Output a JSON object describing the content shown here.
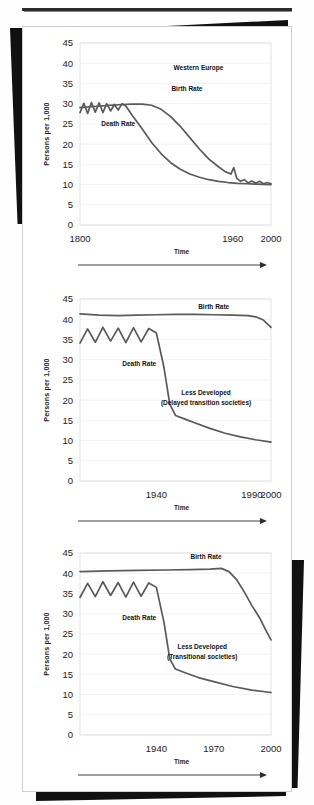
{
  "page": {
    "kind": "textbook-figure-scan",
    "ylabel": "Persons per 1,000",
    "xtitle": "Time",
    "series_names": {
      "birth": "Birth Rate",
      "death": "Death Rate"
    },
    "line_color": "#5a5a5a",
    "text_color": "#1c1c1c",
    "y_ticks": [
      "0",
      "5",
      "10",
      "15",
      "20",
      "25",
      "30",
      "35",
      "40",
      "45"
    ]
  },
  "chart_data": [
    {
      "type": "line",
      "title": "Western Europe",
      "xlabel": "Time",
      "ylabel": "Persons per 1,000",
      "ylim": [
        0,
        45
      ],
      "xlim": [
        1800,
        2000
      ],
      "grid": true,
      "legend": "inline-annotations",
      "xtick_labels": [
        "1800",
        "1960",
        "2000"
      ],
      "xtick_values": [
        1800,
        1960,
        2000
      ],
      "ytick_labels": [
        "0",
        "5",
        "10",
        "15",
        "20",
        "25",
        "30",
        "35",
        "40",
        "45"
      ],
      "annotations": [
        "Western Europe",
        "Birth Rate",
        "Death Rate"
      ],
      "series": [
        {
          "name": "Birth Rate",
          "x": [
            1800,
            1815,
            1830,
            1845,
            1855,
            1865,
            1875,
            1885,
            1895,
            1905,
            1915,
            1925,
            1935,
            1945,
            1952,
            1958,
            1961,
            1964,
            1968,
            1972,
            1976,
            1980,
            1984,
            1988,
            1992,
            1996,
            2000
          ],
          "values": [
            29.0,
            29.3,
            29.6,
            29.8,
            29.9,
            29.9,
            29.6,
            28.6,
            26.8,
            24.4,
            21.6,
            18.8,
            16.3,
            14.4,
            13.2,
            12.6,
            14.2,
            11.6,
            10.8,
            11.2,
            10.4,
            10.9,
            10.3,
            10.8,
            10.2,
            10.5,
            10.2
          ]
        },
        {
          "name": "Death Rate",
          "x": [
            1800,
            1804,
            1808,
            1812,
            1816,
            1820,
            1824,
            1828,
            1832,
            1836,
            1840,
            1844,
            1848,
            1855,
            1865,
            1875,
            1885,
            1895,
            1905,
            1915,
            1925,
            1935,
            1945,
            1955,
            1965,
            1975,
            1985,
            2000
          ],
          "values": [
            27.8,
            30.1,
            27.6,
            30.3,
            27.9,
            30.2,
            27.8,
            30.0,
            28.2,
            29.8,
            28.4,
            30.0,
            29.4,
            27.0,
            23.8,
            20.4,
            17.6,
            15.4,
            13.8,
            12.6,
            11.8,
            11.2,
            10.8,
            10.5,
            10.3,
            10.2,
            10.1,
            10.0
          ]
        }
      ]
    },
    {
      "type": "line",
      "title": "Less Developed",
      "subtitle": "(Delayed transition societies)",
      "xlabel": "Time",
      "ylabel": "Persons per 1,000",
      "ylim": [
        0,
        45
      ],
      "xlim": [
        1900,
        2000
      ],
      "grid": true,
      "legend": "inline-annotations",
      "xtick_labels": [
        "1940",
        "1990",
        "2000"
      ],
      "xtick_values": [
        1940,
        1990,
        2000
      ],
      "ytick_labels": [
        "0",
        "5",
        "10",
        "15",
        "20",
        "25",
        "30",
        "35",
        "40",
        "45"
      ],
      "annotations": [
        "Less Developed",
        "(Delayed transition societies)",
        "Birth Rate",
        "Death Rate"
      ],
      "series": [
        {
          "name": "Birth Rate",
          "x": [
            1900,
            1910,
            1920,
            1930,
            1940,
            1950,
            1960,
            1970,
            1980,
            1988,
            1992,
            1996,
            2000
          ],
          "values": [
            41.3,
            41.0,
            40.9,
            41.0,
            41.1,
            41.2,
            41.2,
            41.1,
            41.0,
            40.9,
            40.6,
            39.8,
            38.0
          ]
        },
        {
          "name": "Death Rate",
          "x": [
            1900,
            1904,
            1908,
            1912,
            1916,
            1920,
            1924,
            1928,
            1932,
            1936,
            1940,
            1944,
            1947,
            1950,
            1955,
            1960,
            1968,
            1976,
            1984,
            1992,
            2000
          ],
          "values": [
            34.1,
            37.6,
            34.3,
            38.0,
            34.6,
            37.8,
            34.2,
            37.9,
            34.4,
            37.7,
            36.6,
            28.0,
            19.0,
            16.2,
            15.3,
            14.4,
            13.0,
            11.8,
            10.9,
            10.2,
            9.6
          ]
        }
      ]
    },
    {
      "type": "line",
      "title": "Less Developed",
      "subtitle": "(Transitional  societies)",
      "xlabel": "Time",
      "ylabel": "Persons per 1,000",
      "ylim": [
        0,
        45
      ],
      "xlim": [
        1900,
        2000
      ],
      "grid": true,
      "legend": "inline-annotations",
      "xtick_labels": [
        "1940",
        "1970",
        "2000"
      ],
      "xtick_values": [
        1940,
        1970,
        2000
      ],
      "ytick_labels": [
        "0",
        "5",
        "10",
        "15",
        "20",
        "25",
        "30",
        "35",
        "40",
        "45"
      ],
      "annotations": [
        "Less Developed",
        "(Transitional  societies)",
        "Birth Rate",
        "Death Rate"
      ],
      "series": [
        {
          "name": "Birth Rate",
          "x": [
            1900,
            1915,
            1930,
            1945,
            1958,
            1968,
            1974,
            1978,
            1982,
            1986,
            1990,
            1994,
            1997,
            2000
          ],
          "values": [
            40.4,
            40.6,
            40.7,
            40.8,
            40.9,
            41.0,
            41.2,
            40.4,
            38.4,
            35.4,
            32.0,
            29.0,
            26.2,
            23.5
          ]
        },
        {
          "name": "Death Rate",
          "x": [
            1900,
            1904,
            1908,
            1912,
            1916,
            1920,
            1924,
            1928,
            1932,
            1936,
            1940,
            1944,
            1947,
            1950,
            1955,
            1962,
            1970,
            1980,
            1990,
            2000
          ],
          "values": [
            34.0,
            37.5,
            34.2,
            37.9,
            34.5,
            37.7,
            34.1,
            37.8,
            34.3,
            37.6,
            36.5,
            27.8,
            18.8,
            16.3,
            15.4,
            14.2,
            13.2,
            12.0,
            11.1,
            10.5
          ]
        }
      ]
    }
  ]
}
